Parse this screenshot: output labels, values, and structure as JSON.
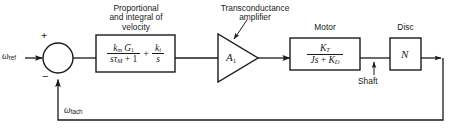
{
  "diagram": {
    "type": "control-system-block-diagram",
    "title_visible": false,
    "background_color": "#ffffff",
    "line_color": "#1a1a1a",
    "input_signal": {
      "symbol": "ω",
      "subscript": "ref",
      "full": "ωref"
    },
    "feedback_signal": {
      "symbol": "ω",
      "subscript": "tach",
      "full": "ωtach"
    },
    "summing_junction": {
      "name": "summing-junction",
      "positive_sign": "+",
      "negative_sign": "−"
    },
    "blocks": [
      {
        "id": "pi-controller",
        "caption_lines": [
          "Proportional",
          "and integral of",
          "velocity"
        ],
        "shape": "rectangle",
        "expression": {
          "term1": {
            "numerator": "kₘ G₁",
            "denominator": "sτₘ + 1",
            "num_parts": [
              {
                "base": "k",
                "sub": "m",
                "style": "italic"
              },
              {
                "base": "G",
                "sub": "1",
                "style": "italic"
              }
            ],
            "den_parts": [
              {
                "base": "s",
                "style": "italic"
              },
              {
                "base": "τ",
                "sub": "M",
                "style": "italic"
              },
              {
                "base": "+ 1",
                "style": "roman"
              }
            ]
          },
          "operator": "+",
          "term2": {
            "numerator": "kᵢ",
            "denominator": "s",
            "num_parts": [
              {
                "base": "k",
                "sub": "i",
                "style": "italic"
              }
            ],
            "den_parts": [
              {
                "base": "s",
                "style": "italic"
              }
            ]
          }
        }
      },
      {
        "id": "transconductance-amplifier",
        "caption_lines": [
          "Transconductance",
          "amplifier"
        ],
        "shape": "triangle",
        "symbol_base": "A",
        "symbol_sub": "1",
        "symbol_full": "A₁",
        "has_leader_line": true
      },
      {
        "id": "motor",
        "caption_lines": [
          "Motor"
        ],
        "shape": "rectangle",
        "expression": {
          "numerator": "Kₜ",
          "denominator": "Js + Kᴅ",
          "num_parts": [
            {
              "base": "K",
              "sub": "T",
              "style": "italic"
            }
          ],
          "den_parts": [
            {
              "base": "J",
              "style": "italic"
            },
            {
              "base": "s",
              "style": "italic"
            },
            {
              "base": "+",
              "style": "roman"
            },
            {
              "base": "K",
              "sub": "D",
              "style": "italic"
            }
          ]
        }
      },
      {
        "id": "disc",
        "caption_lines": [
          "Disc"
        ],
        "shape": "rectangle",
        "symbol_full": "N"
      }
    ],
    "annotations": [
      {
        "id": "shaft",
        "label": "Shaft",
        "pointer": "arrow-up",
        "points_to": "motor-to-disc-connection"
      }
    ]
  }
}
